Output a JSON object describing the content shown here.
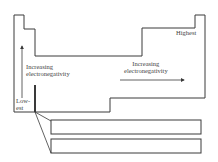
{
  "diagram": {
    "type": "periodic-table-trend-outline",
    "stroke_color": "#3a3a3a",
    "labels": {
      "highest": "Highest",
      "lowest_line1": "Low-",
      "lowest_line2": "est",
      "vertical_trend_line1": "Increasing",
      "vertical_trend_line2": "electronegativity",
      "horizontal_trend_line1": "Increasing",
      "horizontal_trend_line2": "electronegativity"
    },
    "arrows": [
      {
        "name": "vertical-arrow",
        "direction": "up"
      },
      {
        "name": "horizontal-arrow",
        "direction": "right"
      }
    ],
    "f_block_rows": 2
  }
}
